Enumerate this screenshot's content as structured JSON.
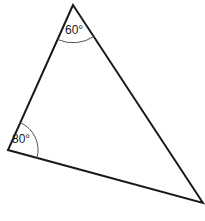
{
  "diagram": {
    "type": "triangle",
    "vertices": {
      "top": {
        "x": 73,
        "y": 5
      },
      "left": {
        "x": 8,
        "y": 150
      },
      "right": {
        "x": 203,
        "y": 203
      }
    },
    "angles": {
      "top": {
        "label": "60°",
        "value": 60
      },
      "left": {
        "label": "80°",
        "value": 80
      },
      "right": {
        "label": "",
        "value": 40
      }
    },
    "colors": {
      "stroke": "#1a1a1a",
      "arc": "#555555",
      "background": "#ffffff"
    }
  }
}
